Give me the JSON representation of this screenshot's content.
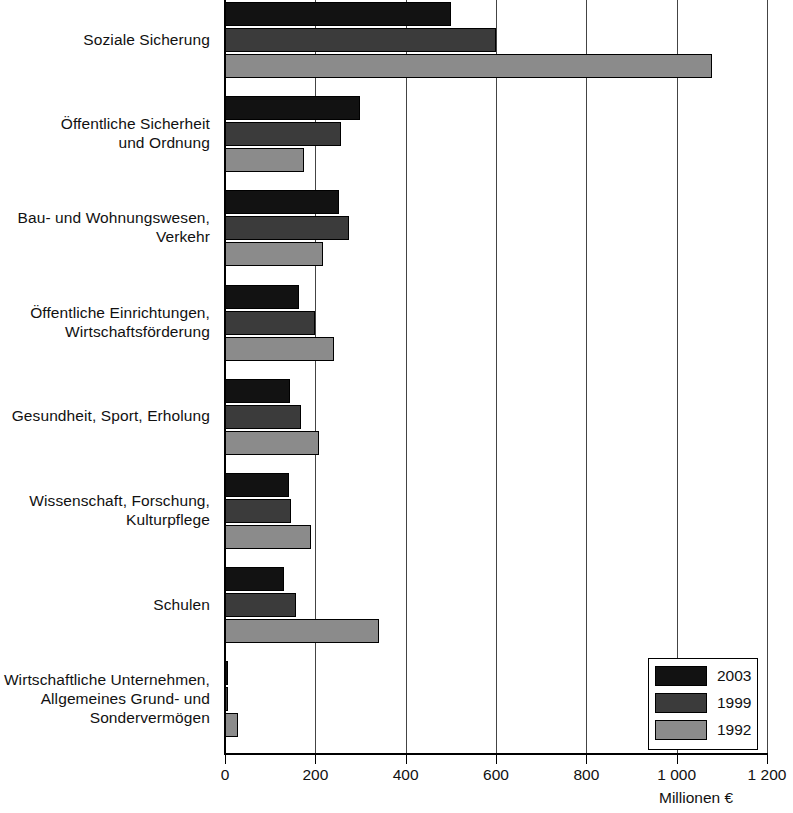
{
  "chart_data": {
    "type": "bar",
    "orientation": "horizontal",
    "title": "",
    "subtitle": "",
    "xlabel": "Millionen €",
    "ylabel": "",
    "xlim": [
      0,
      1200
    ],
    "x_ticks": [
      0,
      200,
      400,
      600,
      800,
      1000,
      1200
    ],
    "x_tick_labels": [
      "0",
      "200",
      "400",
      "600",
      "800",
      "1 000",
      "1 200"
    ],
    "grid": true,
    "grid_axis": "x",
    "legend_position": "bottom-right",
    "categories": [
      "Soziale Sicherung",
      "Öffentliche Sicherheit\nund Ordnung",
      "Bau- und Wohnungswesen,\nVerkehr",
      "Öffentliche Einrichtungen,\nWirtschaftsförderung",
      "Gesundheit, Sport, Erholung",
      "Wissenschaft, Forschung,\nKulturpflege",
      "Schulen",
      "Wirtschaftliche Unternehmen,\nAllgemeines Grund- und\nSondervermögen"
    ],
    "series": [
      {
        "name": "2003",
        "color": "#121212",
        "values": [
          500,
          299,
          252,
          163,
          145,
          141,
          131,
          7
        ]
      },
      {
        "name": "1999",
        "color": "#3b3b3b",
        "values": [
          601,
          256,
          275,
          200,
          168,
          146,
          158,
          7
        ]
      },
      {
        "name": "1992",
        "color": "#8b8b8b",
        "values": [
          1078,
          175,
          216,
          241,
          208,
          190,
          341,
          29
        ]
      }
    ]
  },
  "legend": {
    "items": [
      {
        "label": "2003",
        "color": "#121212"
      },
      {
        "label": "1999",
        "color": "#3b3b3b"
      },
      {
        "label": "1992",
        "color": "#8b8b8b"
      }
    ]
  },
  "axis": {
    "unit_label": "Millionen €"
  }
}
